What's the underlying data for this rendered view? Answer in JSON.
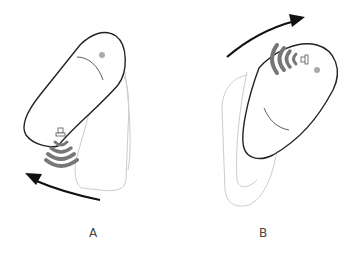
{
  "figure": {
    "panels": [
      {
        "label": "A",
        "description": "Device rotated counter-clockwise; signal waves emitted from lower-left end",
        "rotation_direction": "counter-clockwise"
      },
      {
        "label": "B",
        "description": "Device rotated clockwise; signal waves emitted from upper end",
        "rotation_direction": "clockwise"
      }
    ],
    "colors": {
      "outline": "#222222",
      "ghost_outline": "#cccccc",
      "waves": "#777777",
      "arrow": "#111111",
      "dot": "#aaaaaa"
    }
  }
}
